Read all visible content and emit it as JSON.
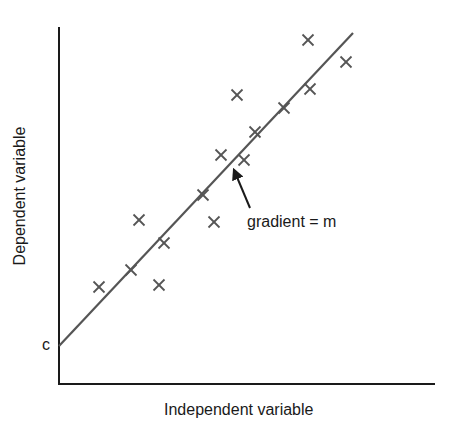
{
  "chart_data": {
    "type": "scatter",
    "title": "",
    "xlabel": "Independent variable",
    "ylabel": "Dependent variable",
    "grid": false,
    "legend": null,
    "axes": {
      "origin_px": [
        59,
        384
      ],
      "y_axis_top_px": 27,
      "x_axis_right_px": 435
    },
    "points_px": [
      [
        99,
        287
      ],
      [
        131,
        270
      ],
      [
        139,
        220
      ],
      [
        159,
        285
      ],
      [
        164,
        243
      ],
      [
        203,
        195
      ],
      [
        214,
        222
      ],
      [
        221,
        155
      ],
      [
        237,
        95
      ],
      [
        244,
        160
      ],
      [
        255,
        132
      ],
      [
        284,
        108
      ],
      [
        308,
        40
      ],
      [
        310,
        89
      ],
      [
        346,
        62
      ]
    ],
    "fit_line_px": {
      "start": [
        59,
        346
      ],
      "end": [
        353,
        33
      ]
    },
    "annotations": [
      {
        "text": "c",
        "meaning": "y-intercept",
        "at_px": [
          48,
          347
        ]
      },
      {
        "text": "gradient = m",
        "meaning": "slope of best-fit line",
        "arrow_from_px": [
          250,
          208
        ],
        "arrow_to_px": [
          233,
          168
        ]
      }
    ],
    "marker": "x",
    "colors": {
      "axes": "#1a1a1a",
      "line": "#555555",
      "markers": "#555555"
    }
  },
  "labels": {
    "y_axis": "Dependent variable",
    "x_axis": "Independent variable",
    "intercept": "c",
    "gradient": "gradient = m"
  }
}
